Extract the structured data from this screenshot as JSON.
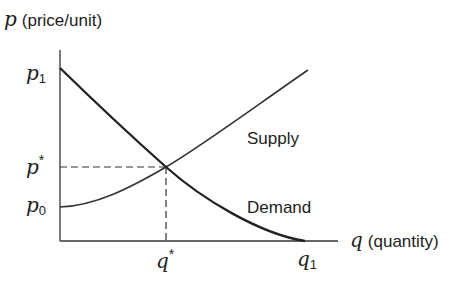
{
  "diagram": {
    "type": "supply-demand",
    "colors": {
      "ink": "#222222",
      "background": "#ffffff"
    },
    "y_axis": {
      "symbol": "p",
      "label": "(price/unit)"
    },
    "x_axis": {
      "symbol": "q",
      "label": "(quantity)"
    },
    "y_ticks": {
      "p1": {
        "base": "p",
        "sub": "1"
      },
      "p_star": {
        "base": "p",
        "sup": "*"
      },
      "p0": {
        "base": "p",
        "sub": "0"
      }
    },
    "x_ticks": {
      "q_star": {
        "base": "q",
        "sup": "*"
      },
      "q1": {
        "base": "q",
        "sub": "1"
      }
    },
    "curves": {
      "supply": {
        "label": "Supply",
        "description": "upward-sloping, convex, from p0 at q=0"
      },
      "demand": {
        "label": "Demand",
        "description": "downward-sloping, convex, from p1 at q=0 to q1 at p=0"
      }
    },
    "equilibrium": {
      "point": "(q*, p*)",
      "guides": "dashed lines to both axes"
    }
  }
}
